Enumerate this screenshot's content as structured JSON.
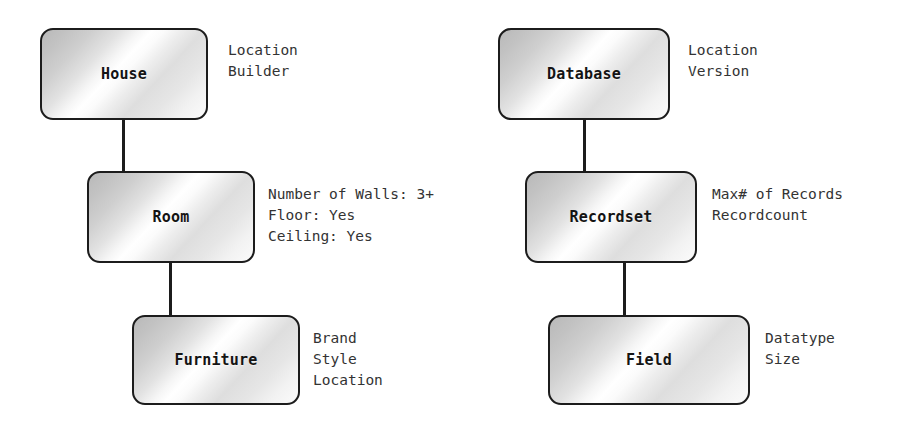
{
  "diagram": {
    "background_color": "#ffffff",
    "node_border_color": "#1c1c1c",
    "node_text_color": "#141414",
    "annotation_text_color": "#333333",
    "columns": [
      {
        "name": "house-hierarchy",
        "nodes": [
          {
            "id": "house",
            "label": "House",
            "attributes": [
              "Location",
              "Builder"
            ]
          },
          {
            "id": "room",
            "label": "Room",
            "attributes": [
              "Number of Walls: 3+",
              "Floor: Yes",
              "Ceiling: Yes"
            ]
          },
          {
            "id": "furniture",
            "label": "Furniture",
            "attributes": [
              "Brand",
              "Style",
              "Location"
            ]
          }
        ]
      },
      {
        "name": "database-hierarchy",
        "nodes": [
          {
            "id": "database",
            "label": "Database",
            "attributes": [
              "Location",
              "Version"
            ]
          },
          {
            "id": "recordset",
            "label": "Recordset",
            "attributes": [
              "Max# of Records",
              "Recordcount"
            ]
          },
          {
            "id": "field",
            "label": "Field",
            "attributes": [
              "Datatype",
              "Size"
            ]
          }
        ]
      }
    ]
  }
}
